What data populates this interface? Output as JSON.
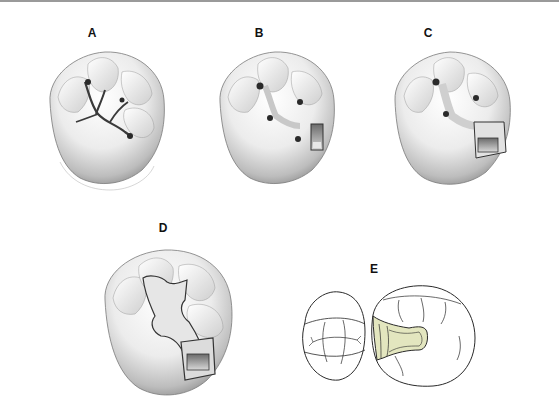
{
  "figure": {
    "panels": [
      {
        "id": "A",
        "label": "A",
        "description": "Mandibular molar occlusal view with cut grooves outlined (outline form)"
      },
      {
        "id": "B",
        "label": "B",
        "description": "Molar with initial occlusal preparation and distal box"
      },
      {
        "id": "C",
        "label": "C",
        "description": "Molar with extended proximal box preparation"
      },
      {
        "id": "D",
        "label": "D",
        "description": "Molar with completed Class II preparation, widened outline"
      },
      {
        "id": "E",
        "label": "E",
        "description": "Line drawing of two adjacent teeth, occlusal view, with proximal preparation shaded"
      }
    ],
    "colors": {
      "tooth_fill": "#f2f2f2",
      "tooth_shadow": "#8c8c8c",
      "groove_dark": "#3a3a3a",
      "prep_fill_E": "#e3e6bf",
      "line_art": "#2a2a2a",
      "top_rule": "#9a9a9a"
    }
  }
}
